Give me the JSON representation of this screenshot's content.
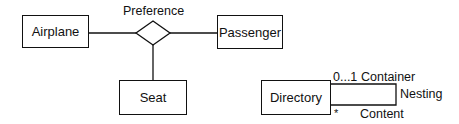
{
  "er_diagram": {
    "entities": [
      {
        "id": "airplane",
        "label": "Airplane"
      },
      {
        "id": "passenger",
        "label": "Passenger"
      },
      {
        "id": "seat",
        "label": "Seat"
      }
    ],
    "relationship": {
      "label": "Preference",
      "shape": "diamond",
      "connects": [
        "airplane",
        "passenger",
        "seat"
      ]
    }
  },
  "class_diagram": {
    "class": {
      "label": "Directory"
    },
    "self_association": {
      "name": "Nesting",
      "end_top": {
        "multiplicity": "0...1",
        "role": "Container"
      },
      "end_bottom": {
        "multiplicity": "*",
        "role": "Content"
      }
    }
  }
}
